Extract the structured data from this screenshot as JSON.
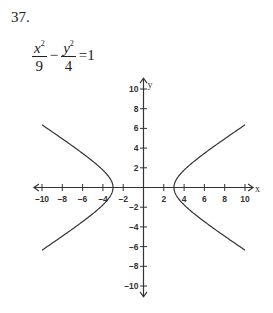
{
  "problem": {
    "number": "37.",
    "equation": {
      "term1_num": "x",
      "term1_exp": "2",
      "term1_den": "9",
      "operator": "−",
      "term2_num": "y",
      "term2_exp": "2",
      "term2_den": "4",
      "equals": "=1"
    }
  },
  "chart_data": {
    "type": "line",
    "xlabel": "x",
    "ylabel": "y",
    "xlim": [
      -10,
      10
    ],
    "ylim": [
      -10,
      10
    ],
    "x_ticks": [
      -10,
      -8,
      -6,
      -4,
      -2,
      2,
      4,
      6,
      8,
      10
    ],
    "y_ticks": [
      -10,
      -8,
      -6,
      -4,
      -2,
      2,
      4,
      6,
      8,
      10
    ],
    "grid": false,
    "series": [
      {
        "name": "right branch",
        "a": 3,
        "b": 2,
        "vertex": [
          3,
          0
        ],
        "x_range": [
          3,
          10
        ]
      },
      {
        "name": "left branch",
        "a": 3,
        "b": 2,
        "vertex": [
          -3,
          0
        ],
        "x_range": [
          -10,
          -3
        ]
      }
    ]
  }
}
